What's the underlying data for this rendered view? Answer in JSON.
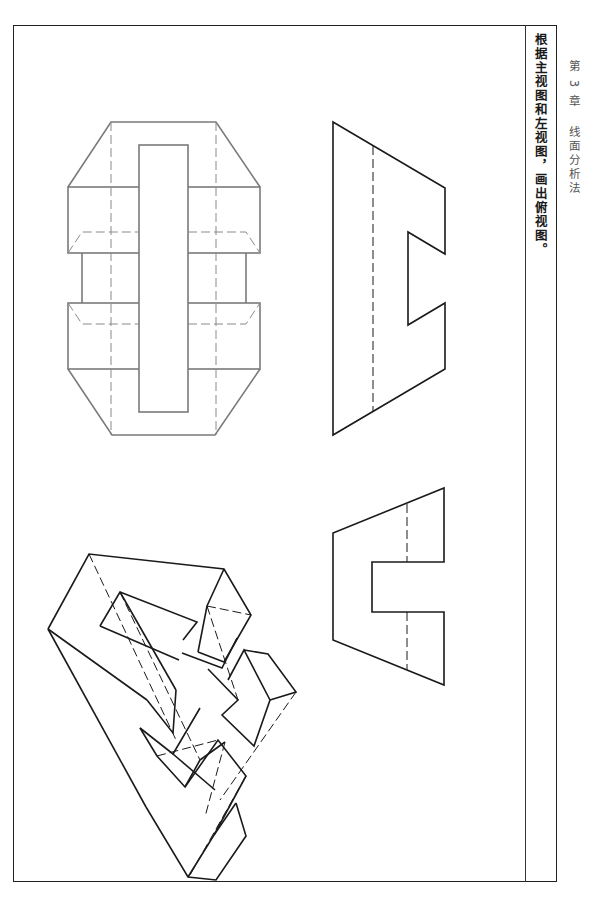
{
  "header": {
    "chapter": "第 3 章",
    "section_title": "线面分析法"
  },
  "exercise": {
    "instruction": "根据主视图和左视图，画出俯视图。"
  },
  "views": [
    {
      "id": "front-view",
      "label": "主视图",
      "color": "#1a1a1a"
    },
    {
      "id": "left-view",
      "label": "左视图",
      "color": "#1a1a1a"
    },
    {
      "id": "top-view",
      "label": "俯视图",
      "color": "#7a7a7a"
    },
    {
      "id": "isometric-view",
      "label": "轴测图",
      "color": "#1a1a1a"
    }
  ]
}
